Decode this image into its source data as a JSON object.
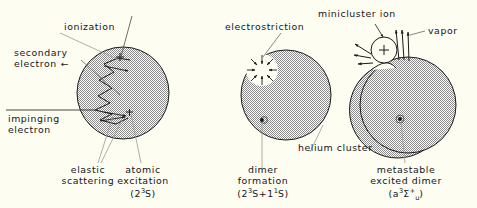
{
  "figure": {
    "background_color": "#fdfdf2",
    "ink_color": "#1a1a1a",
    "hatch_color": "#7d7d7d",
    "panels": [
      {
        "id": "panel-left",
        "caption_lines": [
          "atomic",
          "excitation",
          "(2³S)"
        ],
        "cluster_label": "",
        "annotations": [
          "ionization",
          "secondary electron",
          "impinging electron",
          "elastic scattering"
        ]
      },
      {
        "id": "panel-middle",
        "caption_lines": [
          "dimer",
          "formation",
          "(2³S+1¹S)"
        ],
        "cluster_label": "helium cluster",
        "annotations": [
          "electrostriction"
        ]
      },
      {
        "id": "panel-right",
        "caption_lines": [
          "metastable",
          "excited dimer",
          "(a³Σ⁺ᵤ)"
        ],
        "cluster_label": "",
        "annotations": [
          "minicluster ion",
          "vapor"
        ]
      }
    ]
  },
  "labels": {
    "ionization": "ionization",
    "secondary_electron_line1": "secondary",
    "secondary_electron_line2": "electron",
    "secondary_electron_arrow": "←",
    "impinging_electron_line1": "impinging",
    "impinging_electron_line2": "electron",
    "elastic_line1": "elastic",
    "elastic_line2": "scattering",
    "atomic_line1": "atomic",
    "atomic_line2": "excitation",
    "atomic_line3_open": "(2",
    "atomic_line3_sup": "3",
    "atomic_line3_rest": "S)",
    "electrostriction": "electrostriction",
    "dimer_line1": "dimer",
    "dimer_line2": "formation",
    "dimer_line3_open": "(2",
    "dimer_line3_sup1": "3",
    "dimer_line3_mid": "S+1",
    "dimer_line3_sup2": "1",
    "dimer_line3_rest": "S)",
    "helium_cluster": "helium cluster",
    "minicluster_ion": "minicluster ion",
    "vapor": "vapor",
    "metastable_line1": "metastable",
    "metastable_line2": "excited dimer",
    "meta_line3_open": "(a",
    "meta_line3_sup": "3",
    "meta_line3_sigma": "Σ",
    "meta_line3_sup2": "+",
    "meta_line3_sub": "u",
    "meta_line3_close": ")",
    "plus_sign_left_top": "+",
    "plus_sign_left_mid": "+",
    "plus_sign_minicluster": "+",
    "dot_dimer": "·",
    "dot_metastable": "·"
  },
  "geometry": {
    "left_circle": {
      "cx": 123,
      "cy": 93,
      "r": 46
    },
    "middle_circle": {
      "cx": 286,
      "cy": 95,
      "r": 45
    },
    "right_circle": {
      "cx": 408,
      "cy": 105,
      "r": 48
    },
    "minicluster_circle": {
      "cx": 384,
      "cy": 50,
      "r": 13
    },
    "electrostriction_void": {
      "cx": 262,
      "cy": 70,
      "r": 16
    }
  }
}
